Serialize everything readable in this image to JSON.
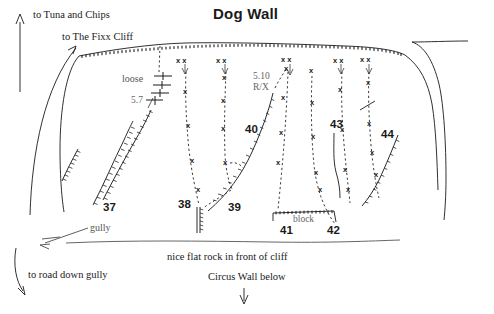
{
  "title": "Dog Wall",
  "directions": {
    "tuna": "to Tuna and Chips",
    "fixx": "to The Fixx Cliff",
    "road": "to road down gully",
    "gully": "gully"
  },
  "annotations": {
    "loose": "loose",
    "grade_57": "5.7",
    "grade_510": "5.10",
    "grade_rx": "R/X",
    "block": "block"
  },
  "bottom_notes": {
    "flat_rock": "nice flat rock in front of cliff",
    "circus_wall": "Circus Wall below"
  },
  "routes": [
    {
      "number": "37",
      "label_x": 103,
      "label_y": 211
    },
    {
      "number": "38",
      "label_x": 178,
      "label_y": 208
    },
    {
      "number": "39",
      "label_x": 228,
      "label_y": 211
    },
    {
      "number": "40",
      "label_x": 245,
      "label_y": 133
    },
    {
      "number": "41",
      "label_x": 280,
      "label_y": 234
    },
    {
      "number": "42",
      "label_x": 327,
      "label_y": 234
    },
    {
      "number": "43",
      "label_x": 332,
      "label_y": 126
    },
    {
      "number": "44",
      "label_x": 381,
      "label_y": 138
    }
  ],
  "bolt_glyphs": {
    "bolt": "x",
    "anchor": "x x"
  },
  "colors": {
    "ink": "#1a1a1a",
    "route_line": "#3a3a3a",
    "note_gray": "#666666",
    "background": "#ffffff"
  }
}
